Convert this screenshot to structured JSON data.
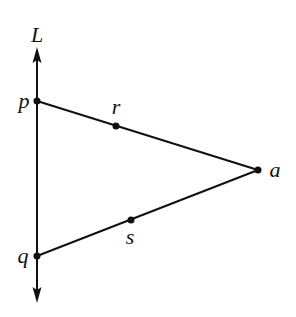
{
  "diagram": {
    "stroke_color": "#111111",
    "background": "#ffffff",
    "line_L": {
      "label": "L",
      "x": 37,
      "y_top_tip": 47,
      "y_bottom_tip": 303,
      "label_pos": [
        37,
        42
      ]
    },
    "points": [
      {
        "id": "p",
        "label": "p",
        "x": 37,
        "y": 101,
        "label_pos": [
          24,
          108
        ]
      },
      {
        "id": "r",
        "label": "r",
        "x": 116,
        "y": 126,
        "label_pos": [
          116,
          114
        ]
      },
      {
        "id": "a",
        "label": "a",
        "x": 258,
        "y": 170,
        "label_pos": [
          275,
          177
        ]
      },
      {
        "id": "s",
        "label": "s",
        "x": 131,
        "y": 220,
        "label_pos": [
          130,
          244
        ]
      },
      {
        "id": "q",
        "label": "q",
        "x": 37,
        "y": 256,
        "label_pos": [
          23,
          263
        ]
      }
    ],
    "segments": [
      {
        "from": "p",
        "to": "a"
      },
      {
        "from": "q",
        "to": "a"
      }
    ]
  }
}
